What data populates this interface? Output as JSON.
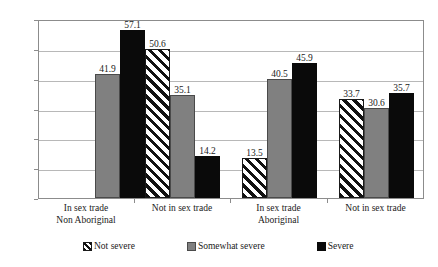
{
  "chart_data": {
    "type": "bar",
    "title": "",
    "subtitle": "",
    "xlabel": "",
    "ylabel": "",
    "ylim": [
      0,
      60
    ],
    "yticks": [
      0,
      10,
      20,
      30,
      40,
      50,
      60
    ],
    "ytick_labels": [
      "0",
      "10",
      "20",
      "30",
      "40",
      "50",
      "60"
    ],
    "grid": true,
    "legend_position": "bottom",
    "categories": [
      "In sex trade",
      "Not in sex trade",
      "In sex trade",
      "Not in sex trade"
    ],
    "group_super_labels": [
      "Non Aboriginal",
      "Aboriginal"
    ],
    "series": [
      {
        "name": "Not severe",
        "color": "#ffffff",
        "pattern": "diagonal-hatch",
        "values": [
          null,
          50.6,
          13.5,
          33.7
        ],
        "value_labels": [
          "",
          "50.6",
          "13.5",
          "33.7"
        ]
      },
      {
        "name": "Somewhat severe",
        "color": "#808080",
        "pattern": "solid",
        "values": [
          41.9,
          35.1,
          40.5,
          30.6
        ],
        "value_labels": [
          "41.9",
          "35.1",
          "40.5",
          "30.6"
        ]
      },
      {
        "name": "Severe",
        "color": "#0a0a0a",
        "pattern": "solid",
        "values": [
          57.1,
          14.2,
          45.9,
          35.7
        ],
        "value_labels": [
          "57.1",
          "14.2",
          "45.9",
          "35.7"
        ]
      }
    ]
  },
  "legend": {
    "items": [
      {
        "label": "Not severe"
      },
      {
        "label": "Somewhat severe"
      },
      {
        "label": "Severe"
      }
    ]
  },
  "axis": {
    "y_tick_labels": [
      "60",
      "50",
      "40",
      "30",
      "20",
      "10",
      "0"
    ]
  },
  "x_axis": {
    "groups": [
      {
        "label": "In sex trade",
        "super": "Non Aboriginal"
      },
      {
        "label": "Not in sex trade",
        "super": ""
      },
      {
        "label": "In sex trade",
        "super": "Aboriginal"
      },
      {
        "label": "Not in sex trade",
        "super": ""
      }
    ]
  }
}
